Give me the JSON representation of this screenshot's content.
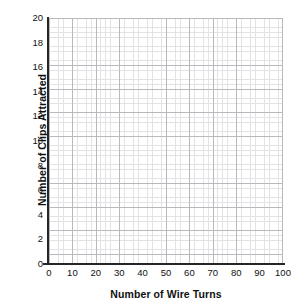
{
  "chart_data": {
    "type": "line",
    "title": "",
    "subtitle": "",
    "xlabel": "Number of Wire Turns",
    "ylabel": "Number of Clips Attracted",
    "xlim": [
      0,
      100
    ],
    "ylim": [
      0,
      20
    ],
    "xticks": [
      0,
      10,
      20,
      30,
      40,
      50,
      60,
      70,
      80,
      90,
      100
    ],
    "yticks": [
      0,
      2,
      4,
      6,
      8,
      10,
      12,
      14,
      16,
      18,
      20
    ],
    "xtick_labels": [
      "0",
      "10",
      "20",
      "30",
      "40",
      "50",
      "60",
      "70",
      "80",
      "90",
      "100"
    ],
    "ytick_labels": [
      "0",
      "2",
      "4",
      "6",
      "8",
      "10",
      "12",
      "14",
      "16",
      "18",
      "20"
    ],
    "x_major_step": 10,
    "y_major_step": 2,
    "x_minor_per_major": 5,
    "y_minor_per_major": 5,
    "grid": true,
    "grid_style": "graph-paper",
    "legend": false,
    "legend_position": "none",
    "series": [],
    "values": [],
    "x": [],
    "annotations": [],
    "colors": {
      "background": "#ffffff",
      "axis": "#262626",
      "grid_major": "#b9b9bd",
      "grid_minor": "#e3e3e6",
      "text": "#111111"
    }
  },
  "axes": {
    "y_title": "Number of Clips Attracted",
    "x_title": "Number of Wire Turns"
  }
}
